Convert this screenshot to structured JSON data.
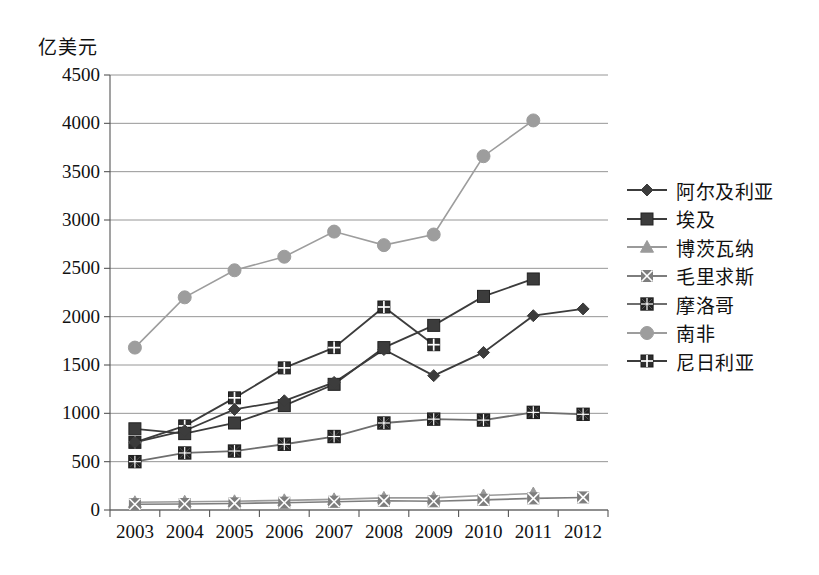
{
  "axis_unit_label": "亿美元",
  "chart_data": {
    "type": "line",
    "title": "",
    "subtitle": "",
    "xlabel": "",
    "ylabel": "亿美元",
    "ylim": [
      0,
      4500
    ],
    "ytick_step": 500,
    "yticks": [
      0,
      500,
      1000,
      1500,
      2000,
      2500,
      3000,
      3500,
      4000,
      4500
    ],
    "ytick_labels": [
      "0",
      "500",
      "1000",
      "1500",
      "2000",
      "2500",
      "3000",
      "3500",
      "4000",
      "4500"
    ],
    "categories": [
      "2003",
      "2004",
      "2005",
      "2006",
      "2007",
      "2008",
      "2009",
      "2010",
      "2011",
      "2012"
    ],
    "x": [
      2003,
      2004,
      2005,
      2006,
      2007,
      2008,
      2009,
      2010,
      2011,
      2012
    ],
    "grid": true,
    "legend_position": "right",
    "series": [
      {
        "name": "阿尔及利亚",
        "marker": "diamond",
        "color": "#3c3c3c",
        "values": [
          700,
          820,
          1040,
          1130,
          1320,
          1660,
          1390,
          1630,
          2010,
          2080
        ]
      },
      {
        "name": "埃及",
        "marker": "square",
        "color": "#3c3c3c",
        "values": [
          840,
          790,
          900,
          1080,
          1300,
          1680,
          1910,
          2210,
          2390,
          null
        ]
      },
      {
        "name": "博茨瓦纳",
        "marker": "triangle",
        "color": "#9a9a9a",
        "values": [
          80,
          85,
          90,
          100,
          110,
          125,
          125,
          150,
          170,
          null
        ]
      },
      {
        "name": "毛里求斯",
        "marker": "x-square-gray",
        "color": "#7d7d7d",
        "values": [
          60,
          62,
          68,
          75,
          85,
          95,
          90,
          105,
          120,
          130
        ]
      },
      {
        "name": "摩洛哥",
        "marker": "x-box",
        "color": "#6e6e6e",
        "values": [
          500,
          590,
          610,
          680,
          760,
          900,
          940,
          930,
          1010,
          990
        ]
      },
      {
        "name": "南非",
        "marker": "circle",
        "color": "#9d9d9d",
        "values": [
          1680,
          2200,
          2480,
          2620,
          2880,
          2740,
          2850,
          3660,
          4030,
          null
        ]
      },
      {
        "name": "尼日利亚",
        "marker": "grid-square",
        "color": "#3c3c3c",
        "values": [
          700,
          870,
          1160,
          1470,
          1680,
          2100,
          1710,
          null,
          null,
          null
        ]
      }
    ]
  }
}
